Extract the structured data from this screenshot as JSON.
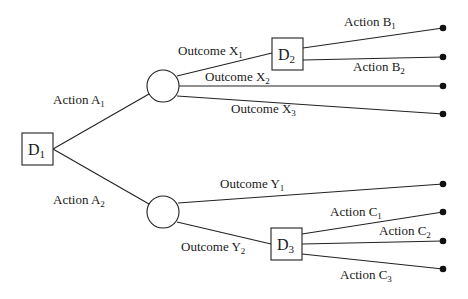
{
  "diagram": {
    "type": "decision-tree",
    "colors": {
      "line": "#222222",
      "text": "#1a1a1a",
      "background": "#ffffff"
    },
    "nodes": {
      "D1": {
        "kind": "decision",
        "label": "D",
        "sub": "1"
      },
      "C1": {
        "kind": "chance"
      },
      "C2": {
        "kind": "chance"
      },
      "D2": {
        "kind": "decision",
        "label": "D",
        "sub": "2"
      },
      "D3": {
        "kind": "decision",
        "label": "D",
        "sub": "3"
      }
    },
    "edges": {
      "a1": {
        "label": "Action A",
        "sub": "1",
        "from": "D1",
        "to": "C1"
      },
      "a2": {
        "label": "Action A",
        "sub": "2",
        "from": "D1",
        "to": "C2"
      },
      "x1": {
        "label": "Outcome X",
        "sub": "1",
        "from": "C1",
        "to": "D2"
      },
      "x2": {
        "label": "Outcome X",
        "sub": "2",
        "from": "C1",
        "to": "end"
      },
      "x3": {
        "label": "Outcome X",
        "sub": "3",
        "from": "C1",
        "to": "end"
      },
      "b1": {
        "label": "Action B",
        "sub": "1",
        "from": "D2",
        "to": "end"
      },
      "b2": {
        "label": "Action B",
        "sub": "2",
        "from": "D2",
        "to": "end"
      },
      "y1": {
        "label": "Outcome Y",
        "sub": "1",
        "from": "C2",
        "to": "end"
      },
      "y2": {
        "label": "Outcome Y",
        "sub": "2",
        "from": "C2",
        "to": "D3"
      },
      "c1": {
        "label": "Action C",
        "sub": "1",
        "from": "D3",
        "to": "end"
      },
      "c2": {
        "label": "Action C",
        "sub": "2",
        "from": "D3",
        "to": "end"
      },
      "c3": {
        "label": "Action C",
        "sub": "3",
        "from": "D3",
        "to": "end"
      }
    },
    "terminal_count": 8
  }
}
